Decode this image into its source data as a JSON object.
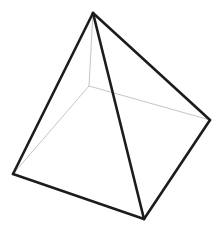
{
  "figure": {
    "name": "square pyramid wireframe",
    "background_color": "#ffffff",
    "canvas": {
      "width": 224,
      "height": 236
    },
    "style": {
      "visible_edge_color": "#1c1c1c",
      "visible_edge_width": 2.6,
      "hidden_edge_color": "#c6c6c6",
      "hidden_edge_width": 1.0,
      "face_color": "#ffffff"
    },
    "vertices": [
      {
        "id": "apex",
        "label": "apex",
        "x": 93,
        "y": 13,
        "hidden": false
      },
      {
        "id": "base_left",
        "label": "base front-left",
        "x": 13,
        "y": 174,
        "hidden": false
      },
      {
        "id": "base_front",
        "label": "base front-bottom",
        "x": 144,
        "y": 219,
        "hidden": false
      },
      {
        "id": "base_right",
        "label": "base front-right",
        "x": 210,
        "y": 120,
        "hidden": false
      },
      {
        "id": "base_back",
        "label": "base back (occluded)",
        "x": 89,
        "y": 86,
        "hidden": true
      }
    ],
    "edges": [
      {
        "id": "apex-left",
        "from": "apex",
        "to": "base_left",
        "hidden": false
      },
      {
        "id": "apex-front",
        "from": "apex",
        "to": "base_front",
        "hidden": false
      },
      {
        "id": "apex-right",
        "from": "apex",
        "to": "base_right",
        "hidden": false
      },
      {
        "id": "base-left-front",
        "from": "base_left",
        "to": "base_front",
        "hidden": false
      },
      {
        "id": "base-front-right",
        "from": "base_front",
        "to": "base_right",
        "hidden": false
      },
      {
        "id": "apex-back",
        "from": "apex",
        "to": "base_back",
        "hidden": true
      },
      {
        "id": "base-back-left",
        "from": "base_back",
        "to": "base_left",
        "hidden": true
      },
      {
        "id": "base-back-right",
        "from": "base_back",
        "to": "base_right",
        "hidden": true
      }
    ],
    "paths": {
      "outline": "M 93 13 L 13 174 L 144 219 L 210 120 Z",
      "edge_apex_left": "M 93 13 L 13 174",
      "edge_apex_front": "M 93 13 L 144 219",
      "edge_apex_right": "M 93 13 L 210 120",
      "edge_base_left_front": "M 13 174 L 144 219",
      "edge_base_front_right": "M 144 219 L 210 120",
      "edge_apex_back": "M 93 13 L 89 86",
      "edge_base_back_left": "M 89 86 L 13 174",
      "edge_base_back_right": "M 89 86 L 210 120"
    }
  }
}
